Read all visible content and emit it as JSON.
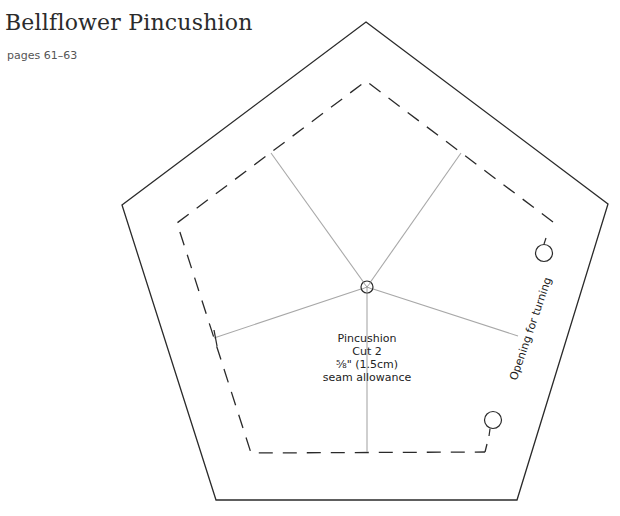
{
  "header": {
    "title": "Bellflower Pincushion",
    "pages": "pages 61–63"
  },
  "pattern": {
    "piece_name": "Pincushion",
    "cut": "Cut 2",
    "seam_allowance_imperial": "⅝\" (1.5cm)",
    "seam_allowance_label": "seam allowance",
    "opening_label": "Opening for turning",
    "colors": {
      "cut_line": "#2a2a2a",
      "seam_line": "#2a2a2a",
      "guide_line": "#a8a8a8"
    }
  }
}
